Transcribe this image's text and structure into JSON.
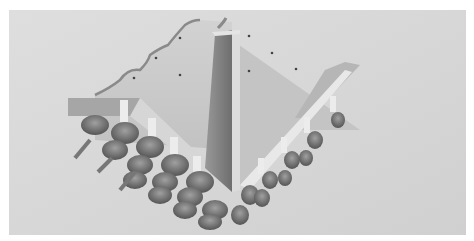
{
  "image": {
    "kind": "3d-architectural-rendering",
    "description": "Grayscale isometric render of a stepped roof structure: a tall central rectangular tower, a large wall with a scalloped stepped top edge on the left, sloping roof planes with small dark dots, and two diagonal arcades of repeated supports with rounded dome-like forms beneath",
    "colors": {
      "border": "#ffffff",
      "background": "#d6d6d6",
      "wall_light": "#c9c9c9",
      "tower_dark": "#7e7e7e",
      "roof_plane": "#bdbdbd",
      "shadow": "#5a5a5a",
      "pillar": "#e6e6e6"
    }
  }
}
